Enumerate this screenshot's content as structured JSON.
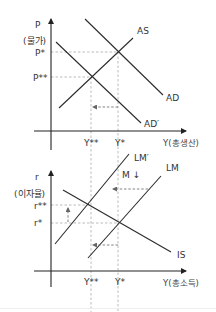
{
  "diagram": {
    "top_panel": {
      "title": "AD-AS model",
      "y_axis": {
        "symbol": "P",
        "label": "(물가)"
      },
      "x_axis": {
        "label": "Y(총생산)"
      },
      "price_levels": {
        "p_star": "P*",
        "p_double_star": "P**"
      },
      "output_levels": {
        "y_double_star": "Y**",
        "y_star": "Y*"
      },
      "curves": {
        "as": "AS",
        "ad": "AD",
        "ad_prime": "AD′"
      }
    },
    "bottom_panel": {
      "title": "IS-LM model",
      "y_axis": {
        "symbol": "r",
        "label": "(이자율)"
      },
      "x_axis": {
        "label": "Y(총소득)"
      },
      "rate_levels": {
        "r_double_star": "r**",
        "r_star": "r*"
      },
      "output_levels": {
        "y_double_star": "Y**",
        "y_star": "Y*"
      },
      "curves": {
        "lm_prime": "LM′",
        "lm": "LM",
        "is": "IS"
      },
      "annotation": "M ↓"
    },
    "colors": {
      "curve": "#2b2b2b",
      "axis": "#222222",
      "guide": "#aaaaaa",
      "shift_arrow": "#666666",
      "text": "#333333"
    }
  }
}
